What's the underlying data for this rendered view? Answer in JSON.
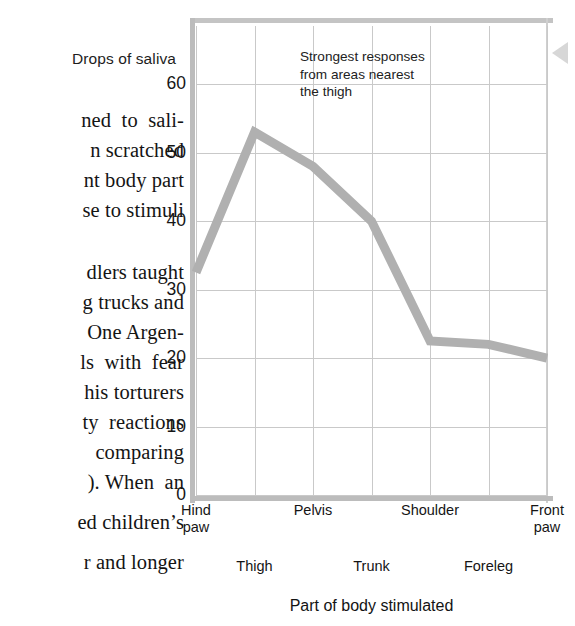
{
  "page": {
    "width": 575,
    "height": 626,
    "background": "#ffffff"
  },
  "book_text": {
    "lines": [
      "ned  to  sali-",
      "n scratched",
      "nt body part",
      "se to stimuli",
      "dlers taught",
      "g trucks and",
      "One Argen-",
      "ls  with  fear",
      "his torturers",
      "ty  reactions",
      "comparing",
      "). When  an",
      "ed children’s",
      "r and longer"
    ]
  },
  "chart_data": {
    "type": "line",
    "title": "",
    "ylabel": "Drops of saliva",
    "xlabel": "Part of body stimulated",
    "categories": [
      "Hind\npaw",
      "Thigh",
      "Pelvis",
      "Trunk",
      "Shoulder",
      "Foreleg",
      "Front\npaw"
    ],
    "category_rows": [
      "top",
      "bottom",
      "top",
      "bottom",
      "top",
      "bottom",
      "top"
    ],
    "values": [
      32.5,
      53,
      48,
      40,
      22.5,
      22,
      20
    ],
    "ylim": [
      0,
      68.5
    ],
    "yticks": [
      0,
      10,
      20,
      30,
      40,
      50,
      60
    ],
    "ytick_labels": [
      "0",
      "10",
      "20",
      "30",
      "40",
      "50",
      "60"
    ],
    "grid": true,
    "legend": "none",
    "line_color": "#b0b0b0",
    "line_width": 9,
    "grid_color": "#c9c9c9",
    "axis_color": "#bcbcbc",
    "annotations": [
      {
        "text": "Strongest responses from areas nearest the thigh",
        "lines": [
          "Strongest responses",
          "from areas nearest",
          "the thigh"
        ]
      }
    ]
  },
  "marker": {
    "name": "left-pointing-triangle",
    "color": "#d7d7d7"
  }
}
